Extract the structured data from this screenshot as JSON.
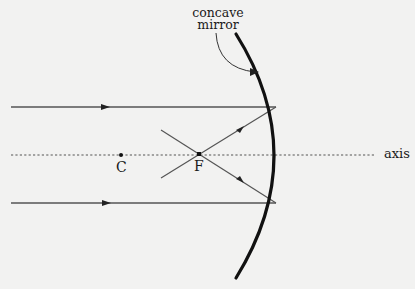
{
  "diagram": {
    "colors": {
      "background": "#f2f2f1",
      "ray": "#555555",
      "mirror": "#111111",
      "axis": "#555555",
      "text": "#1a1a1a"
    },
    "labels": {
      "mirror": [
        "concave",
        "mirror"
      ],
      "center_of_curvature": "C",
      "focal_point": "F",
      "axis": "axis"
    },
    "points": {
      "C": {
        "x": 121,
        "y": 155
      },
      "F": {
        "x": 199,
        "y": 154
      }
    },
    "axis": {
      "y": 155,
      "x_start": 11,
      "x_end": 376,
      "style": "dotted"
    },
    "mirror": {
      "top": {
        "x": 236,
        "y": 34
      },
      "vertex": {
        "x": 283,
        "y": 155
      },
      "bottom": {
        "x": 236,
        "y": 278
      }
    },
    "incident_rays": [
      {
        "from": {
          "x": 11,
          "y": 107
        },
        "to": {
          "x": 276,
          "y": 107
        },
        "arrow_x": 107
      },
      {
        "from": {
          "x": 11,
          "y": 203
        },
        "to": {
          "x": 276,
          "y": 203
        },
        "arrow_x": 107
      }
    ],
    "reflected_rays": [
      {
        "from": {
          "x": 276,
          "y": 107
        },
        "through": {
          "x": 199,
          "y": 154
        },
        "to": {
          "x": 161,
          "y": 178
        }
      },
      {
        "from": {
          "x": 276,
          "y": 203
        },
        "through": {
          "x": 199,
          "y": 154
        },
        "to": {
          "x": 161,
          "y": 130
        }
      }
    ]
  }
}
